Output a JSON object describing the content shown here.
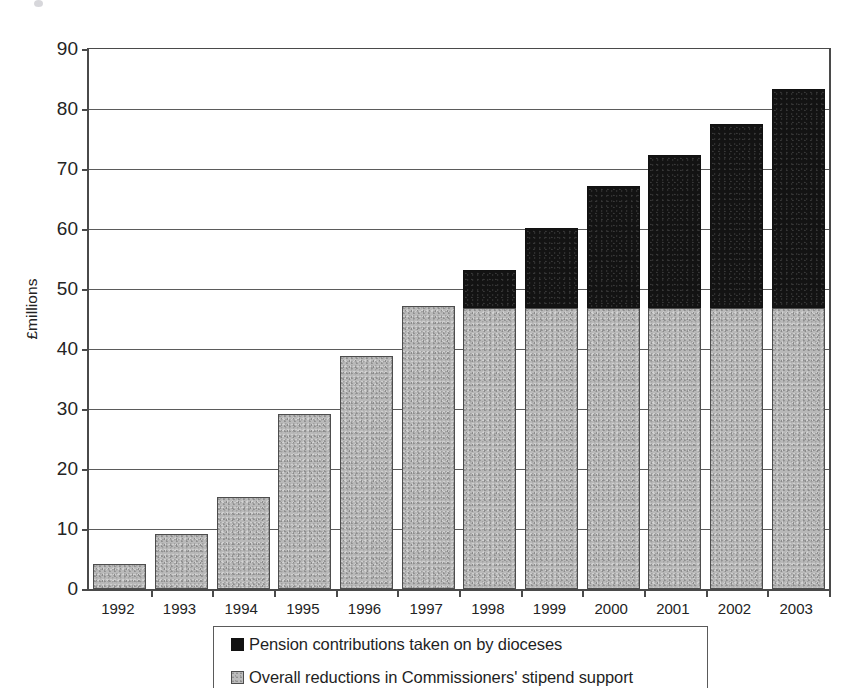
{
  "chart_data": {
    "type": "bar",
    "subtype": "stacked-bar",
    "title": "",
    "xlabel": "",
    "ylabel": "£millions",
    "ylim": [
      0,
      90
    ],
    "ytick_step": 10,
    "yticks": [
      90,
      80,
      70,
      60,
      50,
      40,
      30,
      20,
      10,
      0
    ],
    "grid": true,
    "grid_axis": "y",
    "legend_position": "bottom",
    "categories": [
      "1992",
      "1993",
      "1994",
      "1995",
      "1996",
      "1997",
      "1998",
      "1999",
      "2000",
      "2001",
      "2002",
      "2003"
    ],
    "series": [
      {
        "name": "Overall reductions in Commissioners' stipend  support",
        "color": "#b9b9b9",
        "swatch": "gray-textured",
        "values": [
          4.2,
          9.2,
          15.3,
          29.2,
          38.8,
          47.2,
          46.8,
          46.8,
          46.8,
          46.8,
          46.8,
          46.8
        ]
      },
      {
        "name": "Pension contributions taken on by dioceses",
        "color": "#121212",
        "swatch": "black-solid",
        "values": [
          0,
          0,
          0,
          0,
          0,
          0,
          6.4,
          13.4,
          20.4,
          25.5,
          30.7,
          36.5
        ]
      }
    ],
    "totals": [
      4.2,
      9.2,
      15.3,
      29.2,
      38.8,
      47.2,
      53.2,
      60.2,
      67.2,
      72.3,
      77.5,
      83.3
    ]
  },
  "legend": {
    "entries": [
      {
        "label": "Pension contributions taken on by dioceses",
        "swatch": "black-solid"
      },
      {
        "label": "Overall reductions in Commissioners' stipend  support",
        "swatch": "gray-textured"
      }
    ]
  },
  "axis": {
    "y_title": "£millions"
  }
}
